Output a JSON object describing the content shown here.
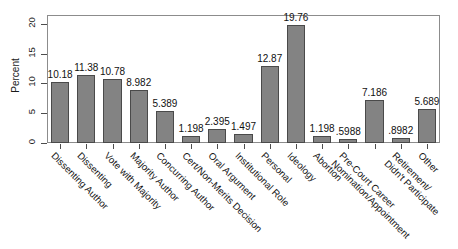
{
  "chart_data": {
    "type": "bar",
    "title": "",
    "subtitle": "",
    "xlabel": "",
    "ylabel": "Percent",
    "ylim": [
      0,
      21.5
    ],
    "yticks": [
      0,
      5,
      10,
      15,
      20
    ],
    "ytick_labels": [
      "0",
      "5",
      "10",
      "15",
      "20"
    ],
    "grid": false,
    "legend": "none",
    "bar_color": "#838383",
    "bar_edge_color": "#4a4a4a",
    "categories": [
      "Dissenting Author",
      "Dissenting",
      "Vote with Majority",
      "Majority Author",
      "Concurring Author",
      "Cert/Non-Merits Decision",
      "Oral Argument",
      "Institutional Role",
      "Personal",
      "Ideology",
      "Abortion",
      "Pre-Court Career",
      "Nomination/Appointment",
      "Retirement/",
      "Other"
    ],
    "category_lines": [
      [
        "Dissenting Author",
        ""
      ],
      [
        "Dissenting",
        ""
      ],
      [
        "Vote with Majority",
        ""
      ],
      [
        "Majority Author",
        ""
      ],
      [
        "Concurring Author",
        ""
      ],
      [
        "Cert/Non-Merits Decision",
        ""
      ],
      [
        "Oral Argument",
        ""
      ],
      [
        "Institutional Role",
        ""
      ],
      [
        "Personal",
        ""
      ],
      [
        "Ideology",
        ""
      ],
      [
        "Abortion",
        ""
      ],
      [
        "Pre-Court Career",
        "Nomination/Appointment"
      ],
      [
        "",
        ""
      ],
      [
        "Retirement/",
        "Didn't Participate"
      ],
      [
        "Other",
        ""
      ]
    ],
    "values": [
      10.18,
      11.38,
      10.78,
      8.982,
      5.389,
      1.198,
      2.395,
      1.497,
      12.87,
      19.76,
      1.198,
      0.5988,
      7.186,
      0.8982,
      5.689
    ],
    "value_labels": [
      "10.18",
      "11.38",
      "10.78",
      "8.982",
      "5.389",
      "1.198",
      "2.395",
      "1.497",
      "12.87",
      "19.76",
      "1.198",
      ".5988",
      "7.186",
      ".8982",
      "5.689"
    ]
  }
}
